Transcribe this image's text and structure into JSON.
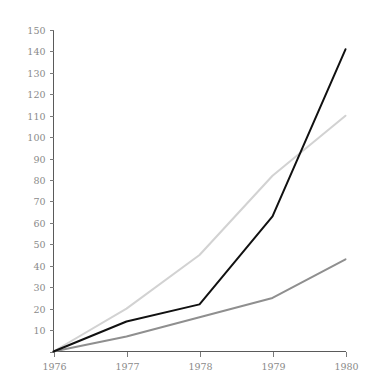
{
  "chart_data": {
    "type": "line",
    "title": "",
    "subtitle": "",
    "xlabel": "",
    "ylabel": "",
    "x": [
      1976,
      1977,
      1978,
      1979,
      1980
    ],
    "categories": [
      "1976",
      "1977",
      "1978",
      "1979",
      "1980"
    ],
    "series": [
      {
        "name": "series-black",
        "color": "#111111",
        "values": [
          0,
          14,
          22,
          63,
          141
        ]
      },
      {
        "name": "series-light-gray",
        "color": "#d2d2d2",
        "values": [
          0,
          20,
          45,
          82,
          110
        ]
      },
      {
        "name": "series-medium-gray",
        "color": "#8f8f8f",
        "values": [
          0,
          7,
          16,
          25,
          43
        ]
      }
    ],
    "xlim": [
      1976,
      1980
    ],
    "ylim": [
      0,
      150
    ],
    "ytick_values": [
      0,
      10,
      20,
      30,
      40,
      50,
      60,
      70,
      80,
      90,
      100,
      110,
      120,
      130,
      140,
      150
    ],
    "ytick_labels": [
      "",
      "10",
      "20",
      "30",
      "40",
      "50",
      "60",
      "70",
      "80",
      "90",
      "100",
      "110",
      "120",
      "130",
      "140",
      "150"
    ],
    "xtick_values": [
      1976,
      1977,
      1978,
      1979,
      1980
    ],
    "xtick_labels": [
      "1976",
      "1977",
      "1978",
      "1979",
      "1980"
    ],
    "grid": false,
    "legend": "none",
    "annotations": []
  },
  "axes": {
    "tick_color": "#7a7a7a",
    "axis_color": "#5a5a5a",
    "label_color": "#8a8a8a",
    "background": "#ffffff"
  }
}
